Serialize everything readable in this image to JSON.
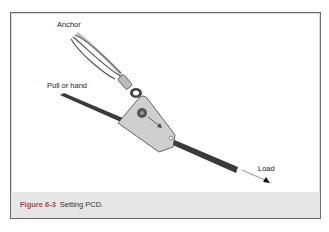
{
  "figure": {
    "labels": {
      "anchor": "Anchor",
      "pull": "Pull or hand",
      "load": "Load"
    },
    "caption": {
      "number": "Figure 6-3",
      "text": "Setting PCD."
    },
    "colors": {
      "frame_border": "#6a6a6a",
      "caption_band": "#e6e6e6",
      "caption_number": "#b0464a",
      "rope": "#3a3a3a",
      "device": "#cfcfcf"
    }
  }
}
